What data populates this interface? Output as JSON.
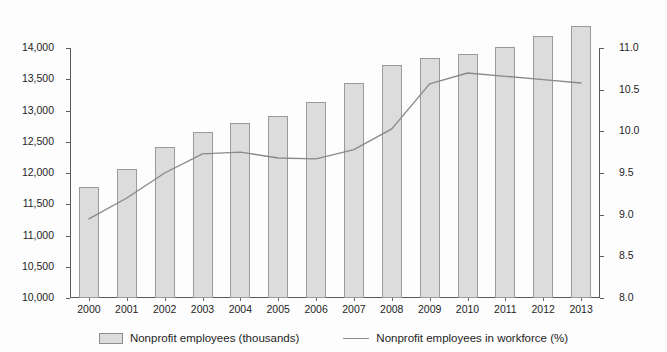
{
  "chart_data": {
    "type": "bar",
    "title": "",
    "subtitle": "",
    "xlabel": "",
    "ylabel": "",
    "grid": false,
    "legend_position": "bottom",
    "categories": [
      "2000",
      "2001",
      "2002",
      "2003",
      "2004",
      "2005",
      "2006",
      "2007",
      "2008",
      "2009",
      "2010",
      "2011",
      "2012",
      "2013"
    ],
    "axes": {
      "x": {
        "tick_labels": [
          "2000",
          "2001",
          "2002",
          "2003",
          "2004",
          "2005",
          "2006",
          "2007",
          "2008",
          "2009",
          "2010",
          "2011",
          "2012",
          "2013"
        ]
      },
      "y_left": {
        "label": "",
        "ylim": [
          10000,
          14000
        ],
        "tick_step": 500,
        "tick_labels": [
          "10,000",
          "10,500",
          "11,000",
          "11,500",
          "12,000",
          "12,500",
          "13,000",
          "13,500",
          "14,000"
        ],
        "tick_values": [
          10000,
          10500,
          11000,
          11500,
          12000,
          12500,
          13000,
          13500,
          14000
        ]
      },
      "y_right": {
        "label": "",
        "ylim": [
          8.0,
          11.0
        ],
        "tick_step": 0.5,
        "tick_labels": [
          "8.0",
          "8.5",
          "9.0",
          "9.5",
          "10.0",
          "10.5",
          "11.0"
        ],
        "tick_values": [
          8.0,
          8.5,
          9.0,
          9.5,
          10.0,
          10.5,
          11.0
        ]
      }
    },
    "series": [
      {
        "name": "Nonprofit employees (thousands)",
        "type": "bar",
        "axis": "y_left",
        "color": "#dcdcdc",
        "edge_color": "#9a9a9a",
        "values": [
          11770,
          12060,
          12420,
          12650,
          12800,
          12910,
          13130,
          13440,
          13730,
          13840,
          13900,
          14020,
          14190,
          14360
        ]
      },
      {
        "name": "Nonprofit employees in workforce (%)",
        "type": "line",
        "axis": "y_right",
        "color": "#8a8a8a",
        "values": [
          8.95,
          9.2,
          9.5,
          9.73,
          9.75,
          9.68,
          9.67,
          9.78,
          10.03,
          10.57,
          10.7,
          10.66,
          10.62,
          10.58
        ]
      }
    ]
  },
  "legend": {
    "items": [
      {
        "label": "Nonprofit employees (thousands)",
        "marker": "bar-swatch"
      },
      {
        "label": "Nonprofit employees in workforce (%)",
        "marker": "line-swatch"
      }
    ]
  },
  "colors": {
    "bar_fill": "#dcdcdc",
    "bar_edge": "#9a9a9a",
    "line": "#8a8a8a",
    "axis": "#5a5a5a",
    "text": "#1d1d1d",
    "background": "#fdfdfd"
  }
}
